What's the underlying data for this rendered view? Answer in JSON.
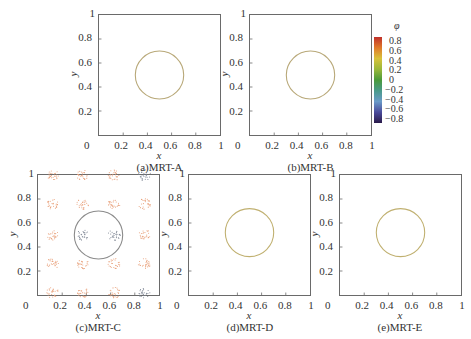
{
  "chart_data": [
    {
      "type": "contour",
      "id": "a",
      "caption": "(a)MRT-A",
      "xlabel": "x",
      "ylabel": "y",
      "xlim": [
        0,
        1
      ],
      "ylim": [
        0,
        1
      ],
      "xticks": [
        "0",
        "0.2",
        "0.4",
        "0.6",
        "0.8",
        "1"
      ],
      "yticks": [
        "0.2",
        "0.4",
        "0.6",
        "0.8",
        "1"
      ],
      "interface_circle": {
        "cx": 0.5,
        "cy": 0.5,
        "r": 0.2,
        "color": "#b8a878"
      },
      "spurious_currents": false
    },
    {
      "type": "contour",
      "id": "b",
      "caption": "(b)MRT-B",
      "xlabel": "x",
      "ylabel": "y",
      "xlim": [
        0,
        1
      ],
      "ylim": [
        0,
        1
      ],
      "xticks": [
        "0",
        "0.2",
        "0.4",
        "0.6",
        "0.8",
        "1"
      ],
      "yticks": [
        "0.2",
        "0.4",
        "0.6",
        "0.8",
        "1"
      ],
      "interface_circle": {
        "cx": 0.5,
        "cy": 0.5,
        "r": 0.2,
        "color": "#b8a878"
      },
      "spurious_currents": false
    },
    {
      "type": "contour",
      "id": "c",
      "caption": "(c)MRT-C",
      "xlabel": "x",
      "ylabel": "y",
      "xlim": [
        0,
        1
      ],
      "ylim": [
        0,
        1
      ],
      "xticks": [
        "0",
        "0.2",
        "0.4",
        "0.6",
        "0.8",
        "1"
      ],
      "yticks": [
        "0.2",
        "0.4",
        "0.6",
        "0.8",
        "1"
      ],
      "interface_circle": {
        "cx": 0.5,
        "cy": 0.5,
        "r": 0.2,
        "color": "#8a8a8a"
      },
      "spurious_currents": true,
      "vortex_clusters_orange": [
        [
          0.12,
          1.0
        ],
        [
          0.37,
          1.0
        ],
        [
          0.63,
          1.0
        ],
        [
          0.12,
          0.76
        ],
        [
          0.37,
          0.76
        ],
        [
          0.63,
          0.76
        ],
        [
          0.88,
          0.76
        ],
        [
          0.12,
          0.5
        ],
        [
          0.88,
          0.5
        ],
        [
          0.12,
          0.26
        ],
        [
          0.37,
          0.26
        ],
        [
          0.63,
          0.26
        ],
        [
          0.88,
          0.26
        ],
        [
          0.12,
          0.02
        ],
        [
          0.37,
          0.02
        ],
        [
          0.63,
          0.02
        ]
      ],
      "vortex_clusters_gray": [
        [
          0.37,
          0.5
        ],
        [
          0.63,
          0.5
        ],
        [
          0.88,
          1.0
        ],
        [
          0.88,
          0.02
        ]
      ]
    },
    {
      "type": "contour",
      "id": "d",
      "caption": "(d)MRT-D",
      "xlabel": "x",
      "ylabel": "y",
      "xlim": [
        0,
        1
      ],
      "ylim": [
        0,
        1
      ],
      "xticks": [
        "0",
        "0.2",
        "0.4",
        "0.6",
        "0.8",
        "1"
      ],
      "yticks": [
        "0.2",
        "0.4",
        "0.6",
        "0.8",
        "1"
      ],
      "interface_circle": {
        "cx": 0.5,
        "cy": 0.52,
        "r": 0.2,
        "color": "#c0b070"
      },
      "spurious_currents": false
    },
    {
      "type": "contour",
      "id": "e",
      "caption": "(e)MRT-E",
      "xlabel": "x",
      "ylabel": "y",
      "xlim": [
        0,
        1
      ],
      "ylim": [
        0,
        1
      ],
      "xticks": [
        "0",
        "0.2",
        "0.4",
        "0.6",
        "0.8",
        "1"
      ],
      "yticks": [
        "0.2",
        "0.4",
        "0.6",
        "0.8",
        "1"
      ],
      "interface_circle": {
        "cx": 0.5,
        "cy": 0.52,
        "r": 0.2,
        "color": "#c0b070"
      },
      "spurious_currents": false
    }
  ],
  "colorbar": {
    "title": "φ",
    "labels": [
      "0.8",
      "0.6",
      "0.4",
      "0.2",
      "0",
      "−0.2",
      "−0.4",
      "−0.6",
      "−0.8"
    ],
    "colors": [
      "#c0302a",
      "#e07a2a",
      "#d8c23a",
      "#9ab83a",
      "#4a9a3a",
      "#4a9a8a",
      "#6a9ac8",
      "#4a4a9a",
      "#2a1a4a"
    ]
  }
}
